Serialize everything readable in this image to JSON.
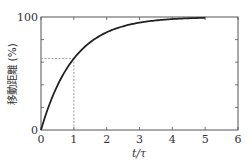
{
  "chart_data": {
    "type": "line",
    "title": "",
    "xlabel": "t/τ",
    "ylabel": "移動距離 (%)",
    "xlim": [
      0,
      6
    ],
    "ylim": [
      0,
      100
    ],
    "x_ticks": [
      "0",
      "1",
      "2",
      "3",
      "4",
      "5",
      "6"
    ],
    "y_ticks_labeled": [
      "0",
      "100"
    ],
    "y_minor_ticks": [
      20,
      40,
      60,
      80
    ],
    "grid": false,
    "legend": null,
    "series": [
      {
        "name": "1 - exp(-t/τ)",
        "x": [
          0,
          0.25,
          0.5,
          0.75,
          1,
          1.5,
          2,
          2.5,
          3,
          3.5,
          4,
          4.5,
          5
        ],
        "values": [
          0,
          22.1,
          39.3,
          52.8,
          63.2,
          77.7,
          86.5,
          91.8,
          95.0,
          97.0,
          98.2,
          98.9,
          99.3
        ]
      }
    ],
    "annotations": [
      {
        "type": "dashed-guide",
        "x": 1,
        "y": 63.2,
        "description": "dashed lines from t/τ=1 up to curve and across to y-axis at ~63.2%"
      }
    ],
    "colors": {
      "curve": "#222222",
      "axes": "#555555",
      "guide": "#888888"
    }
  }
}
